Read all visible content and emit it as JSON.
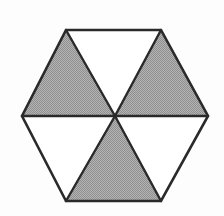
{
  "figure": {
    "name": "hexagon-six-triangles",
    "shape": "regular hexagon divided into six equilateral triangles",
    "background_color": "#fdfdfd",
    "stroke_color": "#2a2a2a",
    "stroke_width": 2.4,
    "fill_shaded": "#a2a2a2",
    "fill_plain": "#ffffff",
    "canvas": {
      "width": 224,
      "height": 216
    },
    "center": {
      "x": 115,
      "y": 116
    },
    "vertices": [
      {
        "name": "top-left",
        "x": 66,
        "y": 30
      },
      {
        "name": "top-right",
        "x": 161,
        "y": 30
      },
      {
        "name": "right",
        "x": 208,
        "y": 116
      },
      {
        "name": "bottom-right",
        "x": 161,
        "y": 201
      },
      {
        "name": "bottom-left",
        "x": 66,
        "y": 201
      },
      {
        "name": "left",
        "x": 22,
        "y": 116
      }
    ],
    "outline_points": "66,30 161,30 208,116 161,201 66,201 22,116",
    "spokes": [
      {
        "name": "spoke-to-top-left",
        "points": "115,116 66,30"
      },
      {
        "name": "spoke-to-top-right",
        "points": "115,116 161,30"
      },
      {
        "name": "spoke-to-right",
        "points": "115,116 208,116"
      },
      {
        "name": "spoke-to-bottom-right",
        "points": "115,116 161,201"
      },
      {
        "name": "spoke-to-bottom-left",
        "points": "115,116 66,201"
      },
      {
        "name": "spoke-to-left",
        "points": "115,116 22,116"
      }
    ],
    "triangles": [
      {
        "name": "triangle-top",
        "position": "top",
        "shaded": false,
        "fill": "#ffffff",
        "points": "66,30 161,30 115,116"
      },
      {
        "name": "triangle-upper-right",
        "position": "upper-right",
        "shaded": true,
        "fill": "#a2a2a2",
        "points": "161,30 208,116 115,116"
      },
      {
        "name": "triangle-lower-right",
        "position": "lower-right",
        "shaded": false,
        "fill": "#ffffff",
        "points": "208,116 161,201 115,116"
      },
      {
        "name": "triangle-bottom",
        "position": "bottom",
        "shaded": true,
        "fill": "#a2a2a2",
        "points": "161,201 66,201 115,116"
      },
      {
        "name": "triangle-lower-left",
        "position": "lower-left",
        "shaded": false,
        "fill": "#ffffff",
        "points": "66,201 22,116 115,116"
      },
      {
        "name": "triangle-upper-left",
        "position": "upper-left",
        "shaded": true,
        "fill": "#a2a2a2",
        "points": "22,116 66,30 115,116"
      }
    ],
    "shaded_count": 3,
    "unshaded_count": 3,
    "total_triangles": 6
  }
}
